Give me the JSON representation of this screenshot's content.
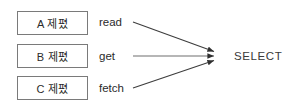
{
  "diagram": {
    "type": "many-to-one mapping diagram",
    "background_color": "#ffffff",
    "line_color": "#3d3d3d",
    "box_border_color": "#7a7a7a",
    "text_color": "#2b2b2b",
    "products": [
      {
        "label": "A 제폈",
        "box_name": "product-box-a"
      },
      {
        "label": "B 제폈",
        "box_name": "product-box-b"
      },
      {
        "label": "C 제폈",
        "box_name": "product-box-c"
      }
    ],
    "operations": [
      {
        "label": "read"
      },
      {
        "label": "get"
      },
      {
        "label": "fetch"
      }
    ],
    "target": {
      "label": "SELECT"
    },
    "edges": [
      {
        "from": "read",
        "to": "SELECT"
      },
      {
        "from": "get",
        "to": "SELECT"
      },
      {
        "from": "fetch",
        "to": "SELECT"
      }
    ]
  }
}
